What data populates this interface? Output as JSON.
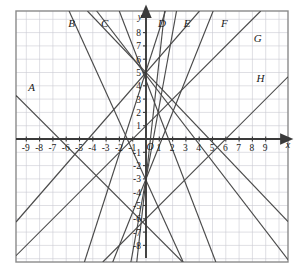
{
  "figure": {
    "title": "",
    "background_color": "#ffffff",
    "frame_color": "#8a8a8a",
    "grid_color": "#c9c9d2",
    "axis_color": "#4a4a4a",
    "line_color": "#4a4a4a"
  },
  "axes": {
    "x_axis_label": "x",
    "y_axis_label": "y",
    "origin_label": "O",
    "x_ticks": [
      "-9",
      "-8",
      "-7",
      "-6",
      "-5",
      "-4",
      "-3",
      "-2",
      "-1",
      "1",
      "2",
      "3",
      "4",
      "5",
      "6",
      "7",
      "8",
      "9"
    ],
    "y_ticks": [
      "8",
      "7",
      "6",
      "5",
      "4",
      "3",
      "2",
      "1",
      "-1",
      "-2",
      "-3",
      "-4",
      "-5",
      "-6",
      "-7",
      "-8"
    ],
    "x_range": [
      -10,
      10
    ],
    "y_range": [
      -9,
      9
    ]
  },
  "chart_data": {
    "type": "line",
    "title": "",
    "xlabel": "x",
    "ylabel": "y",
    "xlim": [
      -10,
      10
    ],
    "ylim": [
      -9,
      9
    ],
    "grid": true,
    "legend": "inline-labels",
    "categories": [],
    "series": [
      {
        "name": "A",
        "label": "A",
        "slope": -1,
        "intercept": -6.5,
        "label_x": -8.6,
        "label_y": 3.6,
        "x_intercept": -6.5,
        "y_intercept": -6.5
      },
      {
        "name": "B",
        "label": "B",
        "slope": -2.6,
        "intercept": 4.4,
        "label_x": -5.6,
        "label_y": 8.4,
        "x_intercept": 1.7,
        "y_intercept": 4.4
      },
      {
        "name": "C",
        "label": "C",
        "slope": -1.3,
        "intercept": 4.8,
        "label_x": -3.1,
        "label_y": 8.4,
        "x_intercept": 3.7,
        "y_intercept": 4.8
      },
      {
        "name": "D",
        "label": "D",
        "slope": 9,
        "intercept": -3,
        "label_x": 1.2,
        "label_y": 8.4,
        "x_intercept": 0.33,
        "y_intercept": -3
      },
      {
        "name": "E",
        "label": "E",
        "slope": 5.5,
        "intercept": -3,
        "label_x": 3.1,
        "label_y": 8.4,
        "x_intercept": 0.55,
        "y_intercept": -3
      },
      {
        "name": "F",
        "label": "F",
        "slope": 2.5,
        "intercept": -3,
        "label_x": 5.9,
        "label_y": 8.4,
        "x_intercept": 1.2,
        "y_intercept": -3
      },
      {
        "name": "G",
        "label": "G",
        "slope": 1,
        "intercept": 1,
        "label_x": 8.4,
        "label_y": 7.3,
        "x_intercept": -1,
        "y_intercept": 1
      },
      {
        "name": "H",
        "label": "H",
        "slope": 1,
        "intercept": -6,
        "label_x": 8.6,
        "label_y": 4.3,
        "x_intercept": 6,
        "y_intercept": -6
      }
    ],
    "extra_lines": [
      {
        "name": "steep-descending-left",
        "slope": -2.2,
        "intercept": -3.1
      },
      {
        "name": "ascending-from-lower-left",
        "slope": 1.15,
        "intercept": 5.0
      },
      {
        "name": "descending-to-lower-right",
        "slope": -1.05,
        "intercept": 5.0
      },
      {
        "name": "steep-ascending-center",
        "slope": 3.1,
        "intercept": 5.1
      }
    ]
  }
}
